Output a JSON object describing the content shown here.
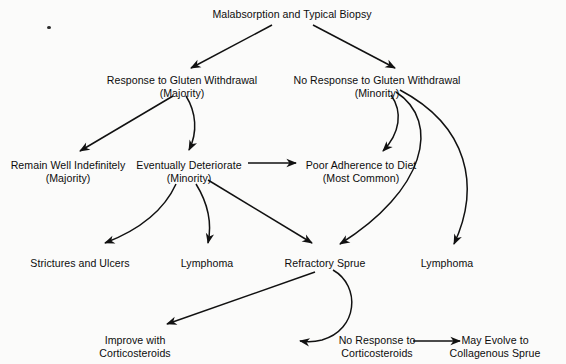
{
  "diagram": {
    "title_node": "Malabsorption and Typical Biopsy",
    "nodes": [
      {
        "id": "root",
        "line1": "Malabsorption and Typical Biopsy",
        "line2": "",
        "x": 292,
        "y": 8
      },
      {
        "id": "response",
        "line1": "Response to Gluten Withdrawal",
        "line2": "(Majority)",
        "x": 182,
        "y": 74
      },
      {
        "id": "noresponse",
        "line1": "No Response to Gluten Withdrawal",
        "line2": "(Minority)",
        "x": 377,
        "y": 74
      },
      {
        "id": "remainwell",
        "line1": "Remain Well Indefinitely",
        "line2": "(Majority)",
        "x": 68,
        "y": 159
      },
      {
        "id": "deteriorate",
        "line1": "Eventually Deteriorate",
        "line2": "(Minority)",
        "x": 189,
        "y": 159
      },
      {
        "id": "pooradher",
        "line1": "Poor Adherence to Diet",
        "line2": "(Most Common)",
        "x": 361,
        "y": 159
      },
      {
        "id": "strictures",
        "line1": "Strictures and Ulcers",
        "line2": "",
        "x": 80,
        "y": 257
      },
      {
        "id": "lymphoma1",
        "line1": "Lymphoma",
        "line2": "",
        "x": 207,
        "y": 257
      },
      {
        "id": "refractory",
        "line1": "Refractory Sprue",
        "line2": "",
        "x": 325,
        "y": 257
      },
      {
        "id": "lymphoma2",
        "line1": "Lymphoma",
        "line2": "",
        "x": 447,
        "y": 257
      },
      {
        "id": "improve",
        "line1": "Improve with",
        "line2": "Corticosteroids",
        "x": 135,
        "y": 334
      },
      {
        "id": "nocortico",
        "line1": "No Response to",
        "line2": "Corticosteroids",
        "x": 377,
        "y": 334
      },
      {
        "id": "collagenous",
        "line1": "May Evolve to",
        "line2": "Collagenous Sprue",
        "x": 495,
        "y": 334
      }
    ],
    "edges": [
      {
        "from": "root",
        "to": "response",
        "style": "straight"
      },
      {
        "from": "root",
        "to": "noresponse",
        "style": "straight"
      },
      {
        "from": "response",
        "to": "remainwell",
        "style": "straight"
      },
      {
        "from": "response",
        "to": "deteriorate",
        "style": "curved"
      },
      {
        "from": "noresponse",
        "to": "pooradher",
        "style": "curved"
      },
      {
        "from": "noresponse",
        "to": "refractory",
        "style": "curved"
      },
      {
        "from": "noresponse",
        "to": "lymphoma2",
        "style": "curved"
      },
      {
        "from": "deteriorate",
        "to": "strictures",
        "style": "curved"
      },
      {
        "from": "deteriorate",
        "to": "lymphoma1",
        "style": "curved"
      },
      {
        "from": "deteriorate",
        "to": "pooradher",
        "style": "straight"
      },
      {
        "from": "deteriorate",
        "to": "refractory",
        "style": "straight"
      },
      {
        "from": "refractory",
        "to": "improve",
        "style": "straight"
      },
      {
        "from": "refractory",
        "to": "nocortico",
        "style": "curved"
      },
      {
        "from": "nocortico",
        "to": "collagenous",
        "style": "straight"
      }
    ],
    "stroke_color": "#111111",
    "background_color": "#fbfbfa"
  }
}
